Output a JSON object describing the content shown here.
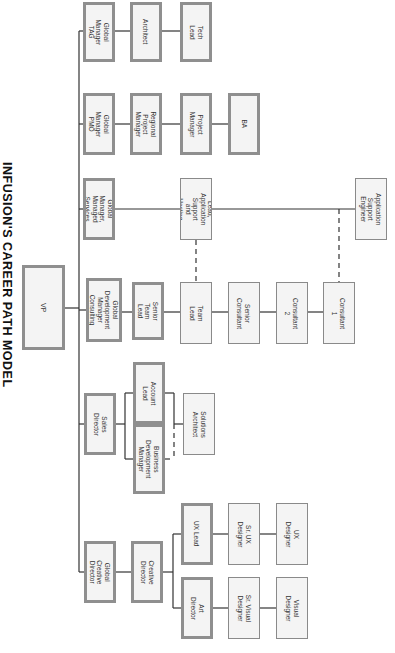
{
  "title": "INFUSION'S CAREER PATH MODEL",
  "colors": {
    "box_fill": "#f4f4f4",
    "box_border": "#8a8a8a",
    "line": "#333333"
  },
  "nodes": [
    {
      "id": "vp",
      "label": "VP",
      "x": 22,
      "y": 265,
      "w": 43,
      "h": 85,
      "style": "thick vp"
    },
    {
      "id": "gm-tag",
      "label": "Global Manager TAG",
      "x": 83,
      "y": 2,
      "w": 32,
      "h": 60,
      "style": "thick"
    },
    {
      "id": "architect",
      "label": "Architect",
      "x": 130,
      "y": 2,
      "w": 32,
      "h": 60,
      "style": "thick"
    },
    {
      "id": "tech-lead",
      "label": "Tech Lead",
      "x": 180,
      "y": 2,
      "w": 32,
      "h": 60,
      "style": "thick"
    },
    {
      "id": "gm-pmo",
      "label": "Global Manager\nPMO",
      "x": 83,
      "y": 93,
      "w": 32,
      "h": 62,
      "style": "thick"
    },
    {
      "id": "regional-pm",
      "label": "Regional Project\nManager",
      "x": 130,
      "y": 93,
      "w": 32,
      "h": 62,
      "style": "thick"
    },
    {
      "id": "project-manager",
      "label": "Project Manager",
      "x": 180,
      "y": 93,
      "w": 32,
      "h": 62,
      "style": "thick"
    },
    {
      "id": "ba",
      "label": "BA",
      "x": 228,
      "y": 93,
      "w": 32,
      "h": 62,
      "style": "thick"
    },
    {
      "id": "gm-managed",
      "label": "Global Manager,\nManaged Services",
      "x": 83,
      "y": 178,
      "w": 32,
      "h": 62,
      "style": "thick"
    },
    {
      "id": "tl-app-support",
      "label": "Team Lead,\nApplication Support\nand Hosting Services",
      "x": 180,
      "y": 178,
      "w": 32,
      "h": 62,
      "style": ""
    },
    {
      "id": "app-support-eng",
      "label": "Application Support\nEngineer",
      "x": 355,
      "y": 178,
      "w": 32,
      "h": 62,
      "style": ""
    },
    {
      "id": "gdm-consulting",
      "label": "Global Development\nManager Consulting",
      "x": 86,
      "y": 278,
      "w": 36,
      "h": 64,
      "style": "thick"
    },
    {
      "id": "senior-team-lead",
      "label": "Senior Team Lead",
      "x": 132,
      "y": 282,
      "w": 32,
      "h": 58,
      "style": "thick"
    },
    {
      "id": "team-lead",
      "label": "Team Lead",
      "x": 180,
      "y": 282,
      "w": 32,
      "h": 62,
      "style": ""
    },
    {
      "id": "senior-consultant",
      "label": "Senior Consultant",
      "x": 228,
      "y": 282,
      "w": 32,
      "h": 62,
      "style": ""
    },
    {
      "id": "consultant-2",
      "label": "Consultant 2",
      "x": 276,
      "y": 282,
      "w": 32,
      "h": 62,
      "style": ""
    },
    {
      "id": "consultant-1",
      "label": "Consultant 1",
      "x": 323,
      "y": 282,
      "w": 32,
      "h": 62,
      "style": ""
    },
    {
      "id": "sales-director",
      "label": "Sales Director",
      "x": 84,
      "y": 393,
      "w": 32,
      "h": 62,
      "style": "thick"
    },
    {
      "id": "account-lead",
      "label": "Account Lead",
      "x": 133,
      "y": 362,
      "w": 32,
      "h": 62,
      "style": "thick"
    },
    {
      "id": "bdm",
      "label": "Business Development\nManager",
      "x": 133,
      "y": 424,
      "w": 32,
      "h": 70,
      "style": "thick"
    },
    {
      "id": "solutions-architect",
      "label": "Solutions Architect",
      "x": 183,
      "y": 393,
      "w": 32,
      "h": 62,
      "style": ""
    },
    {
      "id": "global-creative-director",
      "label": "Global Creative\nDirector",
      "x": 84,
      "y": 541,
      "w": 32,
      "h": 62,
      "style": "thick"
    },
    {
      "id": "creative-director",
      "label": "Creative Director",
      "x": 131,
      "y": 541,
      "w": 32,
      "h": 62,
      "style": "thick"
    },
    {
      "id": "ux-lead",
      "label": "UX Lead",
      "x": 181,
      "y": 503,
      "w": 32,
      "h": 62,
      "style": "thick"
    },
    {
      "id": "sr-ux-designer",
      "label": "Sr. UX Designer",
      "x": 228,
      "y": 503,
      "w": 32,
      "h": 62,
      "style": ""
    },
    {
      "id": "ux-designer",
      "label": "UX Designer",
      "x": 276,
      "y": 503,
      "w": 32,
      "h": 62,
      "style": ""
    },
    {
      "id": "art-director",
      "label": "Art Director",
      "x": 181,
      "y": 577,
      "w": 32,
      "h": 62,
      "style": "thick"
    },
    {
      "id": "sr-visual-designer",
      "label": "Sr. Visual Designer",
      "x": 228,
      "y": 577,
      "w": 32,
      "h": 62,
      "style": ""
    },
    {
      "id": "visual-designer",
      "label": "Visual Designer",
      "x": 276,
      "y": 577,
      "w": 32,
      "h": 62,
      "style": ""
    }
  ],
  "lines": [
    {
      "x1": 79,
      "y1": 31,
      "x2": 79,
      "y2": 572
    },
    {
      "x1": 65,
      "y1": 308,
      "x2": 79,
      "y2": 308
    },
    {
      "x1": 79,
      "y1": 31,
      "x2": 83,
      "y2": 31
    },
    {
      "x1": 79,
      "y1": 124,
      "x2": 83,
      "y2": 124
    },
    {
      "x1": 79,
      "y1": 209,
      "x2": 83,
      "y2": 209
    },
    {
      "x1": 79,
      "y1": 310,
      "x2": 86,
      "y2": 310
    },
    {
      "x1": 79,
      "y1": 424,
      "x2": 84,
      "y2": 424
    },
    {
      "x1": 79,
      "y1": 572,
      "x2": 84,
      "y2": 572
    },
    {
      "x1": 115,
      "y1": 31,
      "x2": 130,
      "y2": 31
    },
    {
      "x1": 162,
      "y1": 31,
      "x2": 180,
      "y2": 31
    },
    {
      "x1": 115,
      "y1": 124,
      "x2": 130,
      "y2": 124
    },
    {
      "x1": 162,
      "y1": 124,
      "x2": 180,
      "y2": 124
    },
    {
      "x1": 212,
      "y1": 124,
      "x2": 228,
      "y2": 124
    },
    {
      "x1": 115,
      "y1": 209,
      "x2": 180,
      "y2": 209
    },
    {
      "x1": 212,
      "y1": 209,
      "x2": 355,
      "y2": 209
    },
    {
      "x1": 122,
      "y1": 312,
      "x2": 132,
      "y2": 312
    },
    {
      "x1": 164,
      "y1": 312,
      "x2": 180,
      "y2": 312
    },
    {
      "x1": 212,
      "y1": 312,
      "x2": 228,
      "y2": 312
    },
    {
      "x1": 260,
      "y1": 312,
      "x2": 276,
      "y2": 312
    },
    {
      "x1": 308,
      "y1": 312,
      "x2": 323,
      "y2": 312
    },
    {
      "x1": 116,
      "y1": 424,
      "x2": 125,
      "y2": 424
    },
    {
      "x1": 125,
      "y1": 393,
      "x2": 125,
      "y2": 459
    },
    {
      "x1": 125,
      "y1": 393,
      "x2": 133,
      "y2": 393
    },
    {
      "x1": 125,
      "y1": 459,
      "x2": 133,
      "y2": 459
    },
    {
      "x1": 165,
      "y1": 393,
      "x2": 174,
      "y2": 393
    },
    {
      "x1": 174,
      "y1": 393,
      "x2": 174,
      "y2": 424
    },
    {
      "x1": 174,
      "y1": 424,
      "x2": 183,
      "y2": 424
    },
    {
      "x1": 116,
      "y1": 572,
      "x2": 131,
      "y2": 572
    },
    {
      "x1": 163,
      "y1": 572,
      "x2": 173,
      "y2": 572
    },
    {
      "x1": 173,
      "y1": 534,
      "x2": 173,
      "y2": 608
    },
    {
      "x1": 173,
      "y1": 534,
      "x2": 181,
      "y2": 534
    },
    {
      "x1": 173,
      "y1": 608,
      "x2": 181,
      "y2": 608
    },
    {
      "x1": 213,
      "y1": 534,
      "x2": 228,
      "y2": 534
    },
    {
      "x1": 260,
      "y1": 534,
      "x2": 276,
      "y2": 534
    },
    {
      "x1": 213,
      "y1": 608,
      "x2": 228,
      "y2": 608
    },
    {
      "x1": 260,
      "y1": 608,
      "x2": 276,
      "y2": 608
    }
  ],
  "dashed_lines": [
    {
      "x1": 196,
      "y1": 240,
      "x2": 196,
      "y2": 282
    },
    {
      "x1": 339,
      "y1": 209,
      "x2": 339,
      "y2": 282
    },
    {
      "x1": 174,
      "y1": 424,
      "x2": 174,
      "y2": 459
    },
    {
      "x1": 165,
      "y1": 459,
      "x2": 174,
      "y2": 459
    }
  ]
}
